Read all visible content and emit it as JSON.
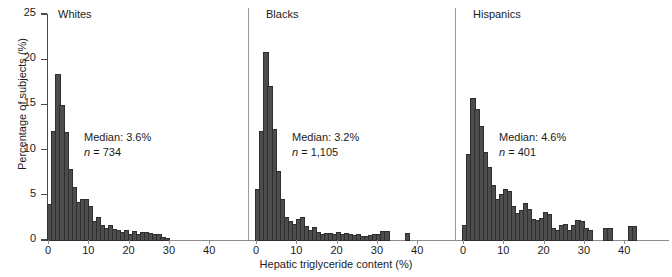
{
  "chart_data": {
    "type": "bar",
    "title": "",
    "xlabel": "Hepatic triglyceride content (%)",
    "ylabel": "Percentage of subjects (%)",
    "ylim": [
      0,
      25
    ],
    "yticks": [
      0,
      5,
      10,
      15,
      20,
      25
    ],
    "xlim": [
      -1,
      44
    ],
    "xticks": [
      0,
      10,
      20,
      30,
      40
    ],
    "grid": false,
    "legend": "none",
    "bin_width": 1,
    "bar_color": "#4d4d4d",
    "panels": [
      {
        "name": "whites",
        "title": "Whites",
        "median_label": "Median: 3.6%",
        "n_label": "n = 734",
        "n_prefix": "n",
        "n_value": " = 734",
        "bin_starts": [
          0,
          1,
          2,
          3,
          4,
          5,
          6,
          7,
          8,
          9,
          10,
          11,
          12,
          13,
          14,
          15,
          16,
          17,
          18,
          19,
          20,
          21,
          22,
          23,
          24,
          25,
          26,
          27,
          28,
          29,
          30,
          31,
          32,
          33,
          34,
          35,
          36,
          37,
          38,
          39,
          40,
          41,
          42,
          43
        ],
        "values": [
          3.9,
          11.9,
          18.3,
          14.8,
          11.8,
          7.8,
          5.8,
          4.1,
          4.4,
          4.4,
          3.6,
          2.0,
          2.4,
          1.5,
          1.2,
          1.6,
          1.1,
          1.0,
          0.8,
          1.0,
          0.6,
          0.9,
          0.5,
          0.8,
          0.8,
          0.7,
          0.6,
          0.5,
          0.2,
          0.1,
          0,
          0,
          0,
          0,
          0,
          0,
          0,
          0,
          0,
          0,
          0,
          0,
          0,
          0
        ]
      },
      {
        "name": "blacks",
        "title": "Blacks",
        "median_label": "Median: 3.2%",
        "n_label": "n = 1,105",
        "n_prefix": "n",
        "n_value": " = 1,105",
        "bin_starts": [
          0,
          1,
          2,
          3,
          4,
          5,
          6,
          7,
          8,
          9,
          10,
          11,
          12,
          13,
          14,
          15,
          16,
          17,
          18,
          19,
          20,
          21,
          22,
          23,
          24,
          25,
          26,
          27,
          28,
          29,
          30,
          31,
          32,
          33,
          34,
          35,
          36,
          37,
          38,
          39,
          40,
          41,
          42,
          43
        ],
        "values": [
          5.5,
          11.9,
          20.7,
          16.9,
          12.2,
          7.5,
          4.4,
          2.4,
          2.0,
          1.7,
          2.2,
          2.4,
          1.4,
          1.0,
          1.3,
          0.8,
          0.5,
          0.7,
          0.7,
          0.5,
          0.8,
          0.6,
          0.7,
          0.6,
          0.4,
          0.5,
          0.3,
          0.3,
          0.4,
          0.6,
          0.6,
          0.9,
          0.9,
          0,
          0,
          0,
          0,
          0.7,
          0,
          0,
          0,
          0,
          0,
          0
        ]
      },
      {
        "name": "hispanics",
        "title": "Hispanics",
        "median_label": "Median: 4.6%",
        "n_label": "n = 401",
        "n_prefix": "n",
        "n_value": " = 401",
        "bin_starts": [
          0,
          1,
          2,
          3,
          4,
          5,
          6,
          7,
          8,
          9,
          10,
          11,
          12,
          13,
          14,
          15,
          16,
          17,
          18,
          19,
          20,
          21,
          22,
          23,
          24,
          25,
          26,
          27,
          28,
          29,
          30,
          31,
          32,
          33,
          34,
          35,
          36,
          37,
          38,
          39,
          40,
          41,
          42,
          43
        ],
        "values": [
          1.5,
          9.4,
          15.6,
          14.4,
          12.5,
          9.6,
          8.0,
          6.0,
          4.4,
          5.0,
          5.5,
          5.3,
          3.6,
          2.9,
          3.2,
          4.0,
          3.3,
          2.2,
          2.1,
          2.3,
          3.0,
          2.8,
          1.2,
          1.0,
          1.6,
          1.7,
          1.0,
          1.5,
          2.1,
          2.0,
          1.2,
          1.0,
          0,
          0,
          0,
          1.2,
          1.2,
          0,
          0,
          0,
          0,
          1.4,
          1.4,
          0
        ]
      }
    ]
  }
}
